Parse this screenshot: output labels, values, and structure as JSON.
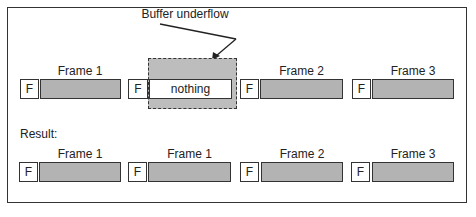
{
  "annotation": "Buffer underflow",
  "row1": {
    "frames": [
      {
        "label": "Frame 1",
        "marker": "F",
        "content": ""
      },
      {
        "label": "",
        "marker": "F",
        "content": "nothing"
      },
      {
        "label": "Frame 2",
        "marker": "F",
        "content": ""
      },
      {
        "label": "Frame 3",
        "marker": "F",
        "content": ""
      }
    ]
  },
  "result_label": "Result:",
  "row2": {
    "frames": [
      {
        "label": "Frame 1",
        "marker": "F"
      },
      {
        "label": "Frame 1",
        "marker": "F"
      },
      {
        "label": "Frame 2",
        "marker": "F"
      },
      {
        "label": "Frame 3",
        "marker": "F"
      }
    ]
  },
  "colors": {
    "frame_fill": "#b3b3b3",
    "border": "#333333",
    "underflow_fill": "#bdbdbd"
  }
}
